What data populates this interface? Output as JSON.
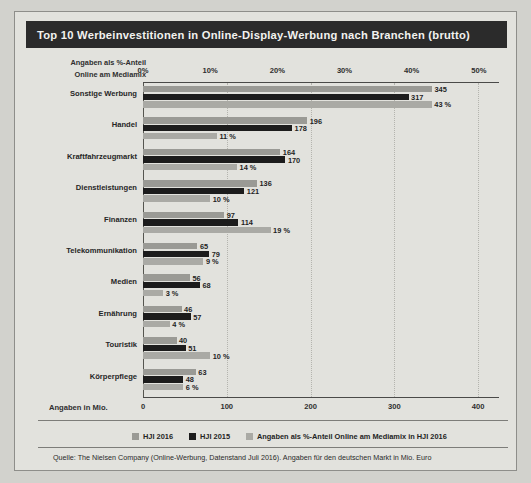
{
  "header": {
    "title": "Top 10 Werbeinvestitionen in Online-Display-Werbung nach Branchen (brutto)"
  },
  "captions": {
    "pct_axis_line1": "Angaben als %-Anteil",
    "pct_axis_line2": "Online am Mediamix",
    "mio_axis": "Angaben in Mio."
  },
  "source": "Quelle: The Nielsen Company (Online-Werbung, Datenstand Juli 2016). Angaben für den deutschen Markt in Mio. Euro",
  "legend": [
    {
      "key": "s2016",
      "label": "HJI 2016",
      "color": "#9a9a95"
    },
    {
      "key": "s2015",
      "label": "HJI 2015",
      "color": "#1c1c1c"
    },
    {
      "key": "spct",
      "label": "Angaben als %-Anteil Online am Mediamix in HJI 2016",
      "color": "#aaaaa5"
    }
  ],
  "chart_data": {
    "type": "bar",
    "title": "Top 10 Werbeinvestitionen in Online-Display-Werbung nach Branchen (brutto)",
    "orientation": "horizontal",
    "grid": true,
    "legend_position": "bottom",
    "categories": [
      "Sonstige Werbung",
      "Handel",
      "Kraftfahrzeugmarkt",
      "Dienstleistungen",
      "Finanzen",
      "Telekommunikation",
      "Medien",
      "Ernährung",
      "Touristik",
      "Körperpflege"
    ],
    "series": [
      {
        "name": "HJI 2016",
        "key": "s2016",
        "unit": "Mio. Euro",
        "axis": "bottom",
        "values": [
          345,
          196,
          164,
          136,
          97,
          65,
          56,
          46,
          40,
          63
        ],
        "labels": [
          "345",
          "196",
          "164",
          "136",
          "97",
          "65",
          "56",
          "46",
          "40",
          "63"
        ]
      },
      {
        "name": "HJI 2015",
        "key": "s2015",
        "unit": "Mio. Euro",
        "axis": "bottom",
        "values": [
          317,
          178,
          170,
          121,
          114,
          79,
          68,
          57,
          51,
          48
        ],
        "labels": [
          "317",
          "178",
          "170",
          "121",
          "114",
          "79",
          "68",
          "57",
          "51",
          "48"
        ]
      },
      {
        "name": "Angaben als %-Anteil Online am Mediamix in HJI 2016",
        "key": "spct",
        "unit": "%",
        "axis": "top",
        "values": [
          43,
          11,
          14,
          10,
          19,
          9,
          3,
          4,
          10,
          6
        ],
        "labels": [
          "43 %",
          "11 %",
          "14 %",
          "10 %",
          "19 %",
          "9 %",
          "3 %",
          "4 %",
          "10 %",
          "6 %"
        ]
      }
    ],
    "bottom_axis": {
      "label": "Angaben in Mio.",
      "ticks": [
        0,
        100,
        200,
        300,
        400
      ],
      "tick_labels": [
        "0",
        "100",
        "200",
        "300",
        "400"
      ],
      "lim": [
        0,
        425
      ]
    },
    "top_axis": {
      "label": "Angaben als %-Anteil Online am Mediamix",
      "ticks": [
        0,
        10,
        20,
        30,
        40,
        50
      ],
      "tick_labels": [
        "0%",
        "10%",
        "20%",
        "30%",
        "40%",
        "50%"
      ],
      "lim": [
        0,
        53
      ]
    }
  }
}
